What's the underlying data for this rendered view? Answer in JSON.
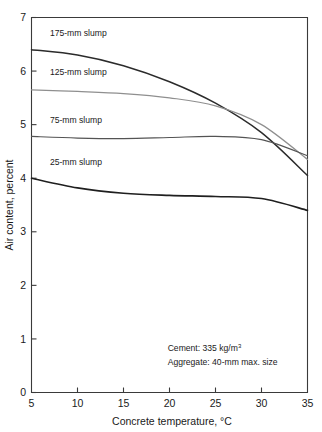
{
  "chart_data": {
    "type": "line",
    "title": "",
    "xlabel": "Concrete temperature, °C",
    "ylabel": "Air content, percent",
    "xlim": [
      5,
      35
    ],
    "ylim": [
      0,
      7
    ],
    "xticks": [
      5,
      10,
      15,
      20,
      25,
      30,
      35
    ],
    "yticks": [
      0,
      1,
      2,
      3,
      4,
      5,
      6,
      7
    ],
    "xtick_labels": [
      "5",
      "10",
      "15",
      "20",
      "25",
      "30",
      "35"
    ],
    "ytick_labels": [
      "0",
      "1",
      "2",
      "3",
      "4",
      "5",
      "6",
      "7"
    ],
    "grid": false,
    "legend_position": "inline-labels",
    "x": [
      5,
      10,
      15,
      20,
      25,
      30,
      35
    ],
    "series": [
      {
        "name": "175-mm slump",
        "color": "#2b2b2b",
        "width": 1.5,
        "values": [
          6.4,
          6.3,
          6.1,
          5.8,
          5.4,
          4.85,
          4.05
        ]
      },
      {
        "name": "125-mm slump",
        "color": "#8f8f8f",
        "width": 1.2,
        "values": [
          5.65,
          5.62,
          5.58,
          5.5,
          5.35,
          5.0,
          4.35
        ]
      },
      {
        "name": "75-mm slump",
        "color": "#545454",
        "width": 1.2,
        "values": [
          4.78,
          4.75,
          4.74,
          4.76,
          4.78,
          4.72,
          4.42
        ]
      },
      {
        "name": "25-mm slump",
        "color": "#1f1f1f",
        "width": 1.6,
        "values": [
          4.0,
          3.82,
          3.72,
          3.68,
          3.66,
          3.62,
          3.4
        ]
      }
    ],
    "annotations": [
      {
        "text": "Cement: 335 kg/m",
        "sup": "3",
        "x": 19.8,
        "y": 0.78
      },
      {
        "text": "Aggregate: 40-mm max. size",
        "sup": "",
        "x": 19.8,
        "y": 0.52
      }
    ],
    "series_labels": [
      {
        "text": "175-mm slump",
        "x": 7.0,
        "y": 6.66
      },
      {
        "text": "125-mm slump",
        "x": 7.0,
        "y": 5.92
      },
      {
        "text": "75-mm slump",
        "x": 7.0,
        "y": 5.03
      },
      {
        "text": "25-mm slump",
        "x": 7.0,
        "y": 4.25
      }
    ]
  }
}
